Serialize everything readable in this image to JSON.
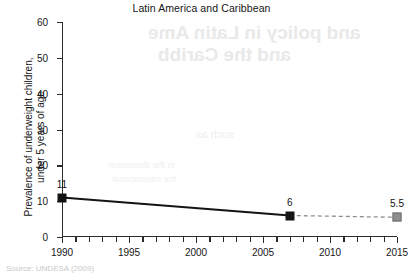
{
  "chart_data": {
    "type": "line",
    "title": "Latin America and Caribbean",
    "xlabel": "",
    "ylabel": "Prevalence of underweight children,\nunder 5 years of age",
    "ylabel_line1": "Prevalence of underweight children,",
    "ylabel_line2": "under 5 years of age",
    "xlim": [
      1990,
      2015
    ],
    "ylim": [
      0,
      60
    ],
    "grid": false,
    "legend": "none",
    "yticks": [
      0,
      10,
      20,
      30,
      40,
      50,
      60
    ],
    "ytick_labels": [
      "0",
      "10",
      "20",
      "30",
      "40",
      "50",
      "60"
    ],
    "xticks": [
      1990,
      1991,
      1992,
      1993,
      1994,
      1995,
      1996,
      1997,
      1998,
      1999,
      2000,
      2001,
      2002,
      2003,
      2004,
      2005,
      2006,
      2007,
      2008,
      2009,
      2010,
      2011,
      2012,
      2013,
      2014,
      2015
    ],
    "xtick_labels_major": [
      "1990",
      "1995",
      "2000",
      "2005",
      "2010",
      "2015"
    ],
    "xticks_major": [
      1990,
      1995,
      2000,
      2005,
      2010,
      2015
    ],
    "x": [
      1990,
      2007,
      2015
    ],
    "values": [
      11,
      6,
      5.5
    ],
    "point_labels": [
      "11",
      "6",
      "5.5"
    ],
    "series": [
      {
        "name": "observed",
        "style": "solid",
        "color": "#141414",
        "marker": "square-black",
        "x": [
          1990,
          2007
        ],
        "values": [
          11,
          6
        ]
      },
      {
        "name": "projected",
        "style": "dashed",
        "color": "#8e8e8e",
        "marker": "square-gray",
        "x": [
          2007,
          2015
        ],
        "values": [
          6,
          5.5
        ]
      }
    ]
  },
  "source_note": "Source: UNDESA (2009)",
  "watermark": {
    "line1": "and policy in Latin Ame",
    "line2": "and the Caribb",
    "line3": "such as",
    "line4": "in the discussion",
    "line5": "the international"
  },
  "colors": {
    "axis": "#2b2b2b",
    "observed": "#141414",
    "projected": "#8e8e8e",
    "text": "#161616",
    "background": "#ffffff"
  }
}
